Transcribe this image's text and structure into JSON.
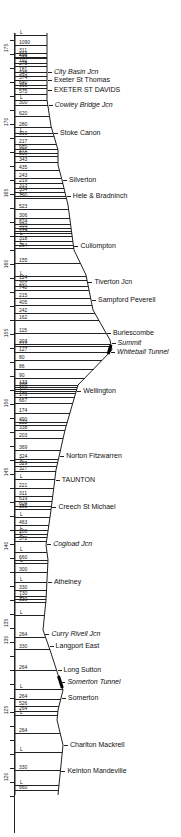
{
  "chart_data": {
    "type": "line",
    "title": "",
    "xlabel": "",
    "ylabel": "Mileposts",
    "axis": {
      "mileposts": [
        {
          "label": "175",
          "y": 48
        },
        {
          "label": "170",
          "y": 122
        },
        {
          "label": "165",
          "y": 193
        },
        {
          "label": "160",
          "y": 264
        },
        {
          "label": "155",
          "y": 333
        },
        {
          "label": "150",
          "y": 403
        },
        {
          "label": "145",
          "y": 472
        },
        {
          "label": "140",
          "y": 546
        },
        {
          "label": "135",
          "y": 623
        },
        {
          "label": "130",
          "y": 640
        },
        {
          "label": "125",
          "y": 710
        },
        {
          "label": "120",
          "y": 777
        }
      ]
    },
    "gradients": [
      {
        "y": 35,
        "label": "L"
      },
      {
        "y": 45,
        "label": "1090"
      },
      {
        "y": 53,
        "label": "311"
      },
      {
        "y": 57,
        "label": "213"
      },
      {
        "y": 58,
        "label": "496"
      },
      {
        "y": 63,
        "label": "192"
      },
      {
        "y": 66,
        "label": "278"
      },
      {
        "y": 72,
        "label": "181"
      },
      {
        "y": 76,
        "label": "345"
      },
      {
        "y": 80,
        "label": "374"
      },
      {
        "y": 85,
        "label": "640"
      },
      {
        "y": 88,
        "label": "366"
      },
      {
        "y": 94,
        "label": "575"
      },
      {
        "y": 100,
        "label": "L"
      },
      {
        "y": 105,
        "label": "300"
      },
      {
        "y": 116,
        "label": "620"
      },
      {
        "y": 127,
        "label": "280"
      },
      {
        "y": 133,
        "label": "L"
      },
      {
        "y": 136,
        "label": "310"
      },
      {
        "y": 144,
        "label": "217"
      },
      {
        "y": 149,
        "label": "685"
      },
      {
        "y": 153,
        "label": "271"
      },
      {
        "y": 156,
        "label": "500"
      },
      {
        "y": 162,
        "label": "343"
      },
      {
        "y": 170,
        "label": "435"
      },
      {
        "y": 178,
        "label": "243"
      },
      {
        "y": 183,
        "label": "219"
      },
      {
        "y": 188,
        "label": "313"
      },
      {
        "y": 192,
        "label": "534"
      },
      {
        "y": 196,
        "label": "L"
      },
      {
        "y": 198,
        "label": "290"
      },
      {
        "y": 209,
        "label": "523"
      },
      {
        "y": 218,
        "label": "306"
      },
      {
        "y": 224,
        "label": "824"
      },
      {
        "y": 228,
        "label": "333"
      },
      {
        "y": 231,
        "label": "212"
      },
      {
        "y": 233,
        "label": "279"
      },
      {
        "y": 236,
        "label": "L"
      },
      {
        "y": 241,
        "label": "318"
      },
      {
        "y": 245,
        "label": "L"
      },
      {
        "y": 248,
        "label": "264"
      },
      {
        "y": 263,
        "label": "155"
      },
      {
        "y": 276,
        "label": "L"
      },
      {
        "y": 280,
        "label": "124"
      },
      {
        "y": 286,
        "label": "207"
      },
      {
        "y": 290,
        "label": "748"
      },
      {
        "y": 298,
        "label": "215"
      },
      {
        "y": 305,
        "label": "405"
      },
      {
        "y": 313,
        "label": "242"
      },
      {
        "y": 320,
        "label": "162"
      },
      {
        "y": 333,
        "label": "115"
      },
      {
        "y": 344,
        "label": "203"
      },
      {
        "y": 346,
        "label": "212"
      },
      {
        "y": 352,
        "label": "127"
      },
      {
        "y": 360,
        "label": "80"
      },
      {
        "y": 369,
        "label": "86"
      },
      {
        "y": 378,
        "label": "90"
      },
      {
        "y": 385,
        "label": "133"
      },
      {
        "y": 387,
        "label": "288"
      },
      {
        "y": 389,
        "label": "L"
      },
      {
        "y": 391,
        "label": "160"
      },
      {
        "y": 393,
        "label": "L"
      },
      {
        "y": 397,
        "label": "170"
      },
      {
        "y": 403,
        "label": "667"
      },
      {
        "y": 413,
        "label": "174"
      },
      {
        "y": 422,
        "label": "490"
      },
      {
        "y": 425,
        "label": "222"
      },
      {
        "y": 430,
        "label": "338"
      },
      {
        "y": 438,
        "label": "203"
      },
      {
        "y": 450,
        "label": "369"
      },
      {
        "y": 459,
        "label": "324"
      },
      {
        "y": 462,
        "label": "L"
      },
      {
        "y": 466,
        "label": "329"
      },
      {
        "y": 471,
        "label": "327"
      },
      {
        "y": 479,
        "label": "L"
      },
      {
        "y": 488,
        "label": "221"
      },
      {
        "y": 496,
        "label": "311"
      },
      {
        "y": 501,
        "label": "619"
      },
      {
        "y": 506,
        "label": "604"
      },
      {
        "y": 509,
        "label": "386"
      },
      {
        "y": 517,
        "label": "L"
      },
      {
        "y": 525,
        "label": "463"
      },
      {
        "y": 530,
        "label": "L"
      },
      {
        "y": 534,
        "label": "286"
      },
      {
        "y": 537,
        "label": "L"
      },
      {
        "y": 541,
        "label": "572"
      },
      {
        "y": 552,
        "label": "L"
      },
      {
        "y": 560,
        "label": "660"
      },
      {
        "y": 563,
        "label": "L"
      },
      {
        "y": 572,
        "label": "300"
      },
      {
        "y": 582,
        "label": "L"
      },
      {
        "y": 590,
        "label": "330"
      },
      {
        "y": 596,
        "label": "730"
      },
      {
        "y": 599,
        "label": "L"
      },
      {
        "y": 602,
        "label": "330"
      },
      {
        "y": 615,
        "label": "L"
      },
      {
        "y": 637,
        "label": "264"
      },
      {
        "y": 649,
        "label": "330"
      },
      {
        "y": 670,
        "label": "264"
      },
      {
        "y": 689,
        "label": "L"
      },
      {
        "y": 699,
        "label": "264"
      },
      {
        "y": 706,
        "label": "526"
      },
      {
        "y": 711,
        "label": "264"
      },
      {
        "y": 715,
        "label": "L"
      },
      {
        "y": 733,
        "label": "264"
      },
      {
        "y": 752,
        "label": "L"
      },
      {
        "y": 770,
        "label": "330"
      },
      {
        "y": 785,
        "label": "L"
      },
      {
        "y": 790,
        "label": "660"
      }
    ],
    "profile_x": [
      {
        "y": 33,
        "x": 47
      },
      {
        "y": 80,
        "x": 47
      },
      {
        "y": 100,
        "x": 47
      },
      {
        "y": 126,
        "x": 51
      },
      {
        "y": 150,
        "x": 58
      },
      {
        "y": 165,
        "x": 58
      },
      {
        "y": 180,
        "x": 62
      },
      {
        "y": 205,
        "x": 68
      },
      {
        "y": 235,
        "x": 72
      },
      {
        "y": 250,
        "x": 74
      },
      {
        "y": 275,
        "x": 86
      },
      {
        "y": 310,
        "x": 93
      },
      {
        "y": 340,
        "x": 110
      },
      {
        "y": 350,
        "x": 112
      },
      {
        "y": 385,
        "x": 78
      },
      {
        "y": 430,
        "x": 65
      },
      {
        "y": 470,
        "x": 56
      },
      {
        "y": 510,
        "x": 51
      },
      {
        "y": 545,
        "x": 46
      },
      {
        "y": 560,
        "x": 48
      },
      {
        "y": 600,
        "x": 46
      },
      {
        "y": 630,
        "x": 43
      },
      {
        "y": 650,
        "x": 50
      },
      {
        "y": 690,
        "x": 63
      },
      {
        "y": 710,
        "x": 58
      },
      {
        "y": 720,
        "x": 57
      },
      {
        "y": 745,
        "x": 63
      },
      {
        "y": 795,
        "x": 58
      }
    ],
    "stations": [
      {
        "name": "City Basin Jcn",
        "y": 72,
        "italic": true
      },
      {
        "name": "Exeter St Thomas",
        "y": 80,
        "italic": false
      },
      {
        "name": "EXETER ST DAVIDS",
        "y": 90,
        "italic": false
      },
      {
        "name": "Cowley Bridge Jcn",
        "y": 105,
        "italic": true
      },
      {
        "name": "Stoke Canon",
        "y": 133,
        "italic": false
      },
      {
        "name": "Silverton",
        "y": 180,
        "italic": false
      },
      {
        "name": "Hele & Bradninch",
        "y": 196,
        "italic": false
      },
      {
        "name": "Cullompton",
        "y": 246,
        "italic": false
      },
      {
        "name": "Tiverton Jcn",
        "y": 282,
        "italic": false
      },
      {
        "name": "Sampford Peverell",
        "y": 300,
        "italic": false
      },
      {
        "name": "Burlescombe",
        "y": 333,
        "italic": false
      },
      {
        "name": "Summit",
        "y": 343,
        "italic": true
      },
      {
        "name": "Whiteball Tunnel",
        "y": 352,
        "italic": true
      },
      {
        "name": "Wellington",
        "y": 391,
        "italic": false
      },
      {
        "name": "Norton Fitzwarren",
        "y": 456,
        "italic": false
      },
      {
        "name": "TAUNTON",
        "y": 480,
        "italic": false
      },
      {
        "name": "Creech St Michael",
        "y": 507,
        "italic": false
      },
      {
        "name": "Cogload Jcn",
        "y": 544,
        "italic": true
      },
      {
        "name": "Athelney",
        "y": 582,
        "italic": false
      },
      {
        "name": "Curry Rivell Jcn",
        "y": 634,
        "italic": true
      },
      {
        "name": "Langport East",
        "y": 646,
        "italic": false
      },
      {
        "name": "Long Sutton",
        "y": 670,
        "italic": false
      },
      {
        "name": "Somerton Tunnel",
        "y": 682,
        "italic": true
      },
      {
        "name": "Somerton",
        "y": 698,
        "italic": false
      },
      {
        "name": "Charlton Mackrell",
        "y": 745,
        "italic": false
      },
      {
        "name": "Keinton Mandeville",
        "y": 771,
        "italic": false
      }
    ],
    "tunnels": [
      {
        "name": "Whiteball Tunnel",
        "y_start": 345,
        "y_end": 354
      },
      {
        "name": "Somerton Tunnel",
        "y_start": 676,
        "y_end": 688
      }
    ],
    "grid": false,
    "legend": null
  }
}
